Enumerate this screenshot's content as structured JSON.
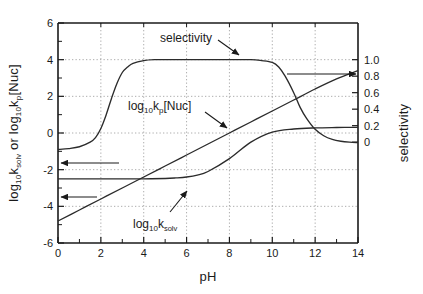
{
  "chart_data": {
    "type": "line",
    "title": "",
    "xlabel": "pH",
    "ylabel_left": "log10ksolv  or  log10kp[Nuc]",
    "ylabel_right": "selectivity",
    "xlim": [
      0,
      14
    ],
    "ylim_left": [
      -6,
      6
    ],
    "ylim_right": [
      0,
      1.0
    ],
    "grid": true,
    "xticks": [
      0,
      2,
      4,
      6,
      8,
      10,
      12,
      14
    ],
    "xtick_labels": [
      "0",
      "2",
      "4",
      "6",
      "8",
      "10",
      "12",
      "14"
    ],
    "yticks_left": [
      -6,
      -4,
      -2,
      0,
      2,
      4,
      6
    ],
    "ytick_labels_left": [
      "-6",
      "-4",
      "-2",
      "0",
      "2",
      "4",
      "6"
    ],
    "yticks_right": [
      0,
      0.2,
      0.4,
      0.6,
      0.8,
      1.0
    ],
    "ytick_labels_right": [
      "0",
      "0.2",
      "0.4",
      "0.6",
      "0.8",
      "1.0"
    ],
    "right_axis_mapping_note": "selectivity 1.0 aligns with left value 4; selectivity 0 aligns with left value -0.5",
    "series": [
      {
        "name": "selectivity",
        "axis": "right",
        "x": [
          0,
          0.5,
          1.0,
          1.5,
          1.75,
          2.0,
          2.25,
          2.5,
          2.75,
          3.0,
          3.25,
          3.5,
          4.0,
          4.5,
          5,
          6,
          7,
          8,
          9,
          9.5,
          10.0,
          10.3,
          10.6,
          11.0,
          11.3,
          11.6,
          12.0,
          12.4,
          12.8,
          13.2,
          13.6,
          14.0
        ],
        "y_left": [
          -0.9,
          -0.85,
          -0.75,
          -0.5,
          -0.25,
          0.25,
          1.0,
          1.9,
          2.7,
          3.3,
          3.6,
          3.8,
          3.95,
          4.0,
          4.0,
          4.0,
          4.0,
          4.0,
          4.0,
          3.95,
          3.85,
          3.6,
          3.1,
          2.2,
          1.4,
          0.8,
          0.2,
          -0.15,
          -0.35,
          -0.45,
          -0.5,
          -0.52
        ],
        "y_right": [
          0.0,
          0.0,
          0.02,
          0.08,
          0.12,
          0.2,
          0.32,
          0.52,
          0.7,
          0.84,
          0.9,
          0.94,
          0.98,
          1.0,
          1.0,
          1.0,
          1.0,
          1.0,
          1.0,
          0.99,
          0.97,
          0.91,
          0.8,
          0.6,
          0.42,
          0.29,
          0.15,
          0.07,
          0.03,
          0.01,
          0.0,
          0.0
        ]
      },
      {
        "name": "log10kp[Nuc]",
        "axis": "left",
        "x": [
          0,
          1,
          2,
          3,
          4,
          5,
          5.5,
          6,
          6.5,
          7,
          8,
          9,
          10,
          11,
          12,
          13,
          14
        ],
        "y_left": [
          -2.5,
          -2.5,
          -2.5,
          -2.5,
          -2.5,
          -2.48,
          -2.45,
          -2.4,
          -2.3,
          -2.1,
          -1.4,
          -0.5,
          0.05,
          0.22,
          0.28,
          0.3,
          0.31
        ]
      },
      {
        "name": "log10ksolv",
        "axis": "left",
        "x": [
          0,
          1,
          2,
          3,
          4,
          5,
          6,
          7,
          8,
          9,
          10,
          11,
          12,
          13,
          14
        ],
        "y_left": [
          -4.8,
          -4.2,
          -3.6,
          -3.0,
          -2.4,
          -1.8,
          -1.2,
          -0.6,
          0.0,
          0.6,
          1.2,
          1.8,
          2.4,
          2.95,
          3.4
        ]
      }
    ],
    "annotations": [
      {
        "name": "selectivity-label",
        "text": "selectivity",
        "x_px": 160,
        "y_px": 38
      },
      {
        "name": "kp-nuc-label",
        "text": "log10kp[Nuc]",
        "x_px": 128,
        "y_px": 104
      },
      {
        "name": "ksolv-label",
        "text": "log10ksolv",
        "x_px": 133,
        "y_px": 222
      },
      {
        "name": "arrow-selectivity",
        "type": "arrow",
        "from": [
          218,
          42
        ],
        "to": [
          240,
          56
        ]
      },
      {
        "name": "arrow-kp-nuc",
        "type": "arrow",
        "from": [
          205,
          112
        ],
        "to": [
          228,
          128
        ]
      },
      {
        "name": "arrow-ksolv",
        "type": "arrow",
        "from": [
          170,
          212
        ],
        "to": [
          187,
          192
        ]
      },
      {
        "name": "arrow-left-upper",
        "type": "arrow",
        "from": [
          118,
          163
        ],
        "to": [
          62,
          163
        ]
      },
      {
        "name": "arrow-left-lower",
        "type": "arrow",
        "from": [
          96,
          197
        ],
        "to": [
          62,
          197
        ]
      },
      {
        "name": "arrow-right-axis",
        "type": "arrow",
        "from": [
          288,
          74
        ],
        "to": [
          356,
          74
        ]
      }
    ]
  },
  "labels": {
    "y_left_part1": "log",
    "y_left_sub1": "10",
    "y_left_part2": "k",
    "y_left_sub2": "solv",
    "y_left_part3": "  or  log",
    "y_left_sub3": "10",
    "y_left_part4": "k",
    "y_left_sub4": "p",
    "y_left_part5": "[Nuc]",
    "y_right": "selectivity",
    "x_axis": "pH",
    "selectivity": "selectivity",
    "kp_main": "log",
    "kp_sub1": "10",
    "kp_k": "k",
    "kp_sub2": "p",
    "kp_tail": "[Nuc]",
    "ksolv_main": "log",
    "ksolv_sub1": "10",
    "ksolv_k": "k",
    "ksolv_sub2": "solv"
  },
  "colors": {
    "axis": "#1a1a1a",
    "curve": "#2b2b2b",
    "grid": "#888888",
    "background": "#ffffff"
  }
}
